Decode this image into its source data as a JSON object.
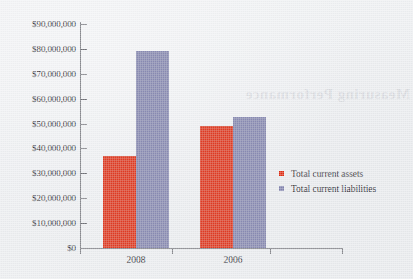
{
  "chart_data": {
    "type": "bar",
    "title": "",
    "xlabel": "",
    "ylabel": "",
    "categories": [
      "2008",
      "2006"
    ],
    "series": [
      {
        "name": "Total current assets",
        "color": "#de2d13",
        "values": [
          37000000,
          49000000
        ]
      },
      {
        "name": "Total current liabilities",
        "color": "#8183ad",
        "values": [
          79000000,
          52500000
        ]
      }
    ],
    "ylim": [
      0,
      90000000
    ],
    "ytick_step": 10000000,
    "ytick_labels": [
      "$90,000,000",
      "$80,000,000",
      "$70,000,000",
      "$60,000,000",
      "$50,000,000",
      "$40,000,000",
      "$30,000,000",
      "$20,000,000",
      "$10,000,000",
      "$0"
    ],
    "ytick_values": [
      90000000,
      80000000,
      70000000,
      60000000,
      50000000,
      40000000,
      30000000,
      20000000,
      10000000,
      0
    ],
    "grid": false,
    "legend_position": "right",
    "legend": [
      {
        "label": "Total current assets",
        "color": "#de2d13"
      },
      {
        "label": "Total current liabilities",
        "color": "#8183ad"
      }
    ]
  },
  "page": {
    "background_color": "#eceef0",
    "axis_color": "#6f7076",
    "text_color": "#2c2c33",
    "bleed_through_text": "Measuring Performance"
  }
}
